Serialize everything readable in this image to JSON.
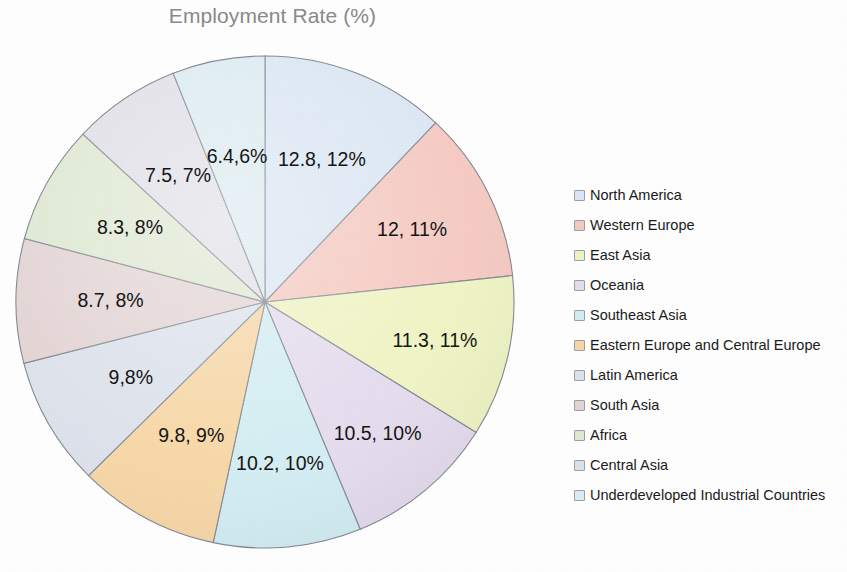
{
  "chart_data": {
    "type": "pie",
    "title": "Employment Rate (%)",
    "legend_position": "right",
    "start_angle_deg": 0,
    "direction": "clockwise",
    "categories": [
      "North America",
      "Western Europe",
      "East Asia",
      "Oceania",
      "Southeast Asia",
      "Eastern Europe and Central Europe",
      "Latin America",
      "South Asia",
      "Africa",
      "Central Asia",
      "Underdeveloped Industrial Countries"
    ],
    "values": [
      12.8,
      12,
      11.3,
      10.5,
      10.2,
      9.8,
      9,
      8.7,
      8.3,
      7.5,
      6.4
    ],
    "percents": [
      12,
      11,
      11,
      10,
      10,
      9,
      8,
      8,
      8,
      7,
      6
    ],
    "slice_labels": [
      "12.8, 12%",
      "12, 11%",
      "11.3, 11%",
      "10.5, 10%",
      "10.2, 10%",
      "9.8, 9%",
      "9,8%",
      "8.7, 8%",
      "8.3, 8%",
      "7.5, 7%",
      "6.4,6%"
    ],
    "colors": [
      "#dbe7f4",
      "#f6c9c0",
      "#eff5c2",
      "#e5dcee",
      "#d3eef3",
      "#f8d7a4",
      "#dde2ec",
      "#e4d4d4",
      "#dfe9d2",
      "#e0e0e8",
      "#dcecf2"
    ],
    "label_radius_frac": [
      0.62,
      0.66,
      0.7,
      0.7,
      0.66,
      0.62,
      0.62,
      0.62,
      0.62,
      0.62,
      0.6
    ],
    "xlabel": "",
    "ylabel": "",
    "grid": false
  },
  "legend": {
    "items": [
      {
        "label": "North America",
        "color": "#dbe7f4"
      },
      {
        "label": "Western Europe",
        "color": "#f6c9c0"
      },
      {
        "label": "East Asia",
        "color": "#eff5c2"
      },
      {
        "label": "Oceania",
        "color": "#e5dcee"
      },
      {
        "label": "Southeast Asia",
        "color": "#d3eef3"
      },
      {
        "label": "Eastern Europe and Central Europe",
        "color": "#f8d7a4"
      },
      {
        "label": "Latin America",
        "color": "#dde2ec"
      },
      {
        "label": "South Asia",
        "color": "#e4d4d4"
      },
      {
        "label": "Africa",
        "color": "#dfe9d2"
      },
      {
        "label": "Central Asia",
        "color": "#e0e0e8"
      },
      {
        "label": "Underdeveloped Industrial Countries",
        "color": "#dcecf2"
      }
    ]
  },
  "geometry": {
    "center_x": 265,
    "center_y": 272,
    "radius_x": 249,
    "radius_y": 246
  }
}
